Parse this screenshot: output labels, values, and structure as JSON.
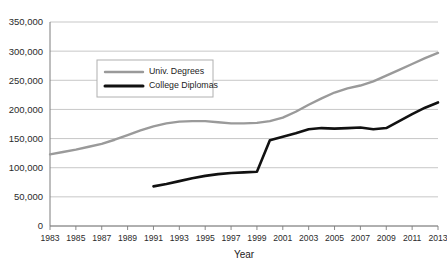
{
  "chart_data": {
    "type": "line",
    "title": "",
    "xlabel": "Year",
    "ylabel": "",
    "grid": true,
    "legend_position": "upper-left-inside",
    "xlim": [
      1983,
      2013
    ],
    "ylim": [
      0,
      350000
    ],
    "ytick_labels": [
      "0",
      "50,000",
      "100,000",
      "150,000",
      "200,000",
      "250,000",
      "300,000",
      "350,000"
    ],
    "ytick_values": [
      0,
      50000,
      100000,
      150000,
      200000,
      250000,
      300000,
      350000
    ],
    "xtick_labels": [
      "1983",
      "1985",
      "1987",
      "1989",
      "1991",
      "1993",
      "1995",
      "1997",
      "1999",
      "2001",
      "2003",
      "2005",
      "2007",
      "2009",
      "2011",
      "2013"
    ],
    "xtick_values": [
      1983,
      1985,
      1987,
      1989,
      1991,
      1993,
      1995,
      1997,
      1999,
      2001,
      2003,
      2005,
      2007,
      2009,
      2011,
      2013
    ],
    "x": [
      1983,
      1984,
      1985,
      1986,
      1987,
      1988,
      1989,
      1990,
      1991,
      1992,
      1993,
      1994,
      1995,
      1996,
      1997,
      1998,
      1999,
      2000,
      2001,
      2002,
      2003,
      2004,
      2005,
      2006,
      2007,
      2008,
      2009,
      2010,
      2011,
      2012,
      2013
    ],
    "series": [
      {
        "name": "Univ. Degrees",
        "color": "#9a9a9a",
        "x": [
          1983,
          1984,
          1985,
          1986,
          1987,
          1988,
          1989,
          1990,
          1991,
          1992,
          1993,
          1994,
          1995,
          1996,
          1997,
          1998,
          1999,
          2000,
          2001,
          2002,
          2003,
          2004,
          2005,
          2006,
          2007,
          2008,
          2009,
          2010,
          2011,
          2012,
          2013
        ],
        "values": [
          123000,
          127000,
          131000,
          136000,
          141000,
          148000,
          156000,
          164000,
          171000,
          176000,
          179000,
          180000,
          180000,
          178000,
          176000,
          176000,
          177000,
          180000,
          186000,
          196000,
          208000,
          219000,
          229000,
          236000,
          241000,
          248000,
          258000,
          268000,
          278000,
          288000,
          297000
        ]
      },
      {
        "name": "College Diplomas",
        "color": "#111111",
        "x": [
          1991,
          1992,
          1993,
          1994,
          1995,
          1996,
          1997,
          1998,
          1999,
          2000,
          2001,
          2002,
          2003,
          2004,
          2005,
          2006,
          2007,
          2008,
          2009,
          2010,
          2011,
          2012,
          2013
        ],
        "values": [
          68000,
          72000,
          77000,
          82000,
          86000,
          89000,
          91000,
          92000,
          93000,
          147000,
          153000,
          159000,
          166000,
          168000,
          167000,
          168000,
          169000,
          166000,
          168000,
          180000,
          192000,
          203000,
          212000
        ]
      }
    ],
    "legend_entries": [
      {
        "label": "Univ. Degrees",
        "color": "#9a9a9a"
      },
      {
        "label": "College Diplomas",
        "color": "#111111"
      }
    ]
  },
  "colors": {
    "background": "#ffffff",
    "grid": "#b9b9b9",
    "axis": "#7d7d7d",
    "text": "#1c1c1c",
    "series_university": "#9a9a9a",
    "series_college": "#111111"
  }
}
